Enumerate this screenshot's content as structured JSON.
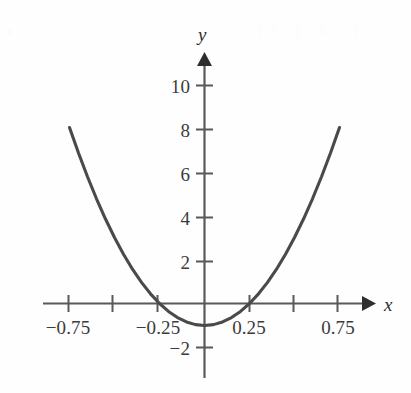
{
  "figure": {
    "width": 411,
    "height": 393,
    "background_color": "#fefefe",
    "curve_color": "#4a4a4a",
    "axis_color": "#595959",
    "text_color": "#3b3b3b"
  },
  "axis_labels": {
    "x": "x",
    "y": "y"
  },
  "chart_data": {
    "type": "line",
    "title": "",
    "xlabel": "x",
    "ylabel": "y",
    "grid": false,
    "legend": null,
    "xlim": [
      -0.9,
      0.9
    ],
    "ylim": [
      -2.6,
      11.0
    ],
    "x_ticks": [
      -0.75,
      -0.5,
      -0.25,
      0.25,
      0.5,
      0.75
    ],
    "x_tick_labels": [
      "−0.75",
      "",
      "−0.25",
      "0.25",
      "",
      "0.75"
    ],
    "y_ticks": [
      -2,
      2,
      4,
      6,
      8,
      10
    ],
    "y_tick_labels": [
      "−2",
      "2",
      "4",
      "6",
      "8",
      "10"
    ],
    "series": [
      {
        "name": "y = 16x² − 1",
        "equation": "y = 16*x^2 - 1",
        "vertex": [
          0,
          -1
        ],
        "roots": [
          -0.25,
          0.25
        ],
        "x_domain": [
          -0.75,
          0.75
        ],
        "x": [
          -0.75,
          -0.7,
          -0.65,
          -0.6,
          -0.55,
          -0.5,
          -0.45,
          -0.4,
          -0.35,
          -0.3,
          -0.25,
          -0.2,
          -0.15,
          -0.1,
          -0.05,
          0.0,
          0.05,
          0.1,
          0.15,
          0.2,
          0.25,
          0.3,
          0.35,
          0.4,
          0.45,
          0.5,
          0.55,
          0.6,
          0.65,
          0.7,
          0.75
        ],
        "values": [
          8.0,
          6.84,
          5.76,
          4.76,
          3.84,
          3.0,
          2.24,
          1.56,
          0.96,
          0.44,
          0.0,
          -0.36,
          -0.64,
          -0.84,
          -0.96,
          -1.0,
          -0.96,
          -0.84,
          -0.64,
          -0.36,
          0.0,
          0.44,
          0.96,
          1.56,
          2.24,
          3.0,
          3.84,
          4.76,
          5.76,
          6.84,
          8.0
        ]
      }
    ]
  }
}
